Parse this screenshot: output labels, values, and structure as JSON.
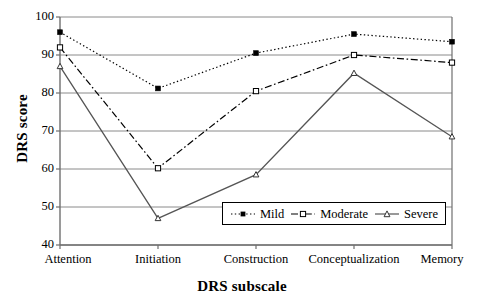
{
  "chart_data": {
    "type": "line",
    "title": "",
    "xlabel": "DRS subscale",
    "ylabel": "DRS score",
    "categories": [
      "Attention",
      "Initiation",
      "Construction",
      "Conceptualization",
      "Memory"
    ],
    "ylim": [
      40,
      100
    ],
    "yticks": [
      40,
      50,
      60,
      70,
      80,
      90,
      100
    ],
    "grid": "horizontal",
    "legend_position": "inside-bottom-right",
    "series": [
      {
        "name": "Mild",
        "values": [
          96,
          81.2,
          90.5,
          95.5,
          93.5
        ],
        "line_style": "dotted",
        "marker": "filled-square",
        "color": "#000000"
      },
      {
        "name": "Moderate",
        "values": [
          92,
          60.2,
          80.5,
          90,
          88
        ],
        "line_style": "dash-dot",
        "marker": "open-square",
        "color": "#000000"
      },
      {
        "name": "Severe",
        "values": [
          87,
          47,
          58.5,
          85.2,
          68.5
        ],
        "line_style": "solid",
        "marker": "triangle",
        "color": "#555555"
      }
    ]
  },
  "axis": {
    "y_title": "DRS score",
    "x_title": "DRS subscale",
    "y_tick_labels": [
      "100",
      "90",
      "80",
      "70",
      "60",
      "50",
      "40"
    ],
    "x_tick_labels": [
      "Attention",
      "Initiation",
      "Construction",
      "Conceptualization",
      "Memory"
    ]
  },
  "legend": {
    "entries": [
      {
        "label": "Mild",
        "swatch": "dotted-filled-square-marker"
      },
      {
        "label": "Moderate",
        "swatch": "dashdot-open-square-marker"
      },
      {
        "label": "Severe",
        "swatch": "solid-triangle-marker"
      }
    ]
  }
}
